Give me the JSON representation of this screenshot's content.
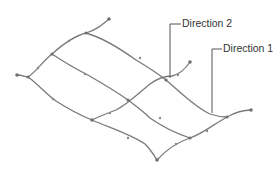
{
  "diagram": {
    "type": "surface-grid",
    "labels": {
      "direction2": "Direction 2",
      "direction1": "Direction 1"
    },
    "colors": {
      "curve": "#7a7a7a",
      "leader": "#555555",
      "text": "#333333",
      "background": "#ffffff"
    }
  }
}
